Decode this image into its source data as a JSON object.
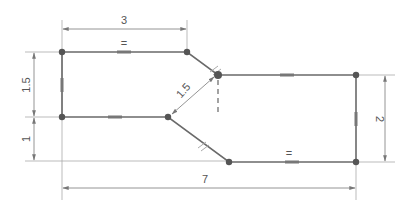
{
  "diagram": {
    "type": "constrained sketch",
    "colors": {
      "profile": "#6a6a6a",
      "constraint_mark": "#777777",
      "dimension": "#8a8a8a",
      "vertex": "#555555",
      "background": "#ffffff"
    },
    "dimensions": {
      "top_width": "3",
      "left_upper_height": "1.5",
      "left_lower_height": "1",
      "diagonal_length": "1.5",
      "right_height": "2",
      "total_width": "7"
    },
    "constraint_symbols": {
      "equal_top": "=",
      "equal_bottom": "=",
      "parallel_diag_upper": "//",
      "parallel_diag_lower": "//"
    }
  }
}
